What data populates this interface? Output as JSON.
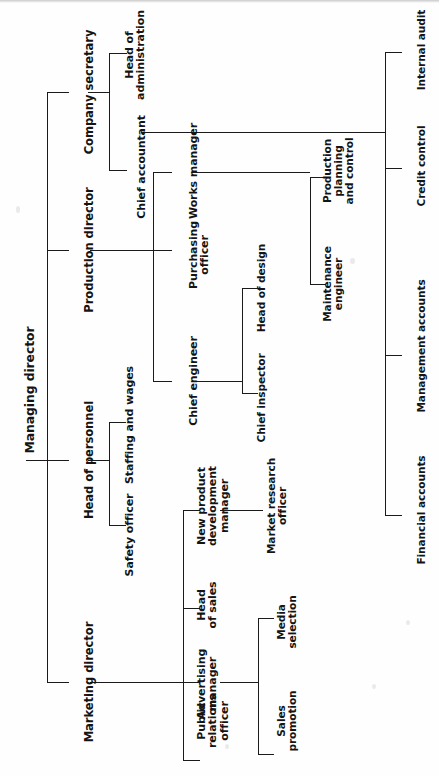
{
  "chart": {
    "type": "org-chart",
    "orientation": "rotated-90-ccw",
    "line_color": "#1a1a1a",
    "background_color": "#fefefe",
    "text_color": "#141414",
    "root": {
      "label": "Managing director",
      "children": [
        {
          "label": "Company secretary",
          "children": [
            {
              "label": "Head of\nadministration",
              "children": []
            },
            {
              "label": "Chief accountant",
              "children": [
                {
                  "label": "Internal audit",
                  "children": []
                },
                {
                  "label": "Credit control",
                  "children": []
                },
                {
                  "label": "Management accounts",
                  "children": []
                },
                {
                  "label": "Financial accounts",
                  "children": []
                }
              ]
            }
          ]
        },
        {
          "label": "Production director",
          "children": [
            {
              "label": "Works manager",
              "children": [
                {
                  "label": "Production\nplanning\nand control",
                  "children": []
                },
                {
                  "label": "Maintenance\nengineer",
                  "children": []
                }
              ]
            },
            {
              "label": "Purchasing\nofficer",
              "children": []
            },
            {
              "label": "Chief engineer",
              "children": [
                {
                  "label": "Head of design",
                  "children": []
                },
                {
                  "label": "Chief inspector",
                  "children": []
                }
              ]
            }
          ]
        },
        {
          "label": "Head of personnel",
          "children": [
            {
              "label": "Staffing and wages",
              "children": []
            },
            {
              "label": "Safety officer",
              "children": []
            }
          ]
        },
        {
          "label": "Marketing director",
          "children": [
            {
              "label": "New product\ndevelopment\nmanager",
              "children": [
                {
                  "label": "Market research\nofficer",
                  "children": []
                }
              ]
            },
            {
              "label": "Head\nof sales",
              "children": []
            },
            {
              "label": "Advertising\nmanager",
              "children": [
                {
                  "label": "Media\nselection",
                  "children": []
                },
                {
                  "label": "Sales\npromotion",
                  "children": []
                }
              ]
            },
            {
              "label": "Public\nrelations\nofficer",
              "children": []
            }
          ]
        }
      ]
    }
  },
  "nodes": {
    "managing_director": "Managing director",
    "company_secretary": "Company secretary",
    "production_director": "Production director",
    "head_of_personnel": "Head of personnel",
    "marketing_director": "Marketing director",
    "head_of_administration": "Head of\nadministration",
    "chief_accountant": "Chief accountant",
    "internal_audit": "Internal audit",
    "credit_control": "Credit control",
    "management_accounts": "Management accounts",
    "financial_accounts": "Financial accounts",
    "works_manager": "Works manager",
    "purchasing_officer": "Purchasing\nofficer",
    "chief_engineer": "Chief engineer",
    "production_planning_and_control": "Production\nplanning\nand control",
    "maintenance_engineer": "Maintenance\nengineer",
    "head_of_design": "Head of design",
    "chief_inspector": "Chief inspector",
    "staffing_and_wages": "Staffing and wages",
    "safety_officer": "Safety officer",
    "new_product_development_manager": "New product\ndevelopment\nmanager",
    "market_research_officer": "Market research\nofficer",
    "head_of_sales": "Head\nof sales",
    "advertising_manager": "Advertising\nmanager",
    "media_selection": "Media\nselection",
    "sales_promotion": "Sales\npromotion",
    "public_relations_officer": "Public\nrelations\nofficer"
  }
}
